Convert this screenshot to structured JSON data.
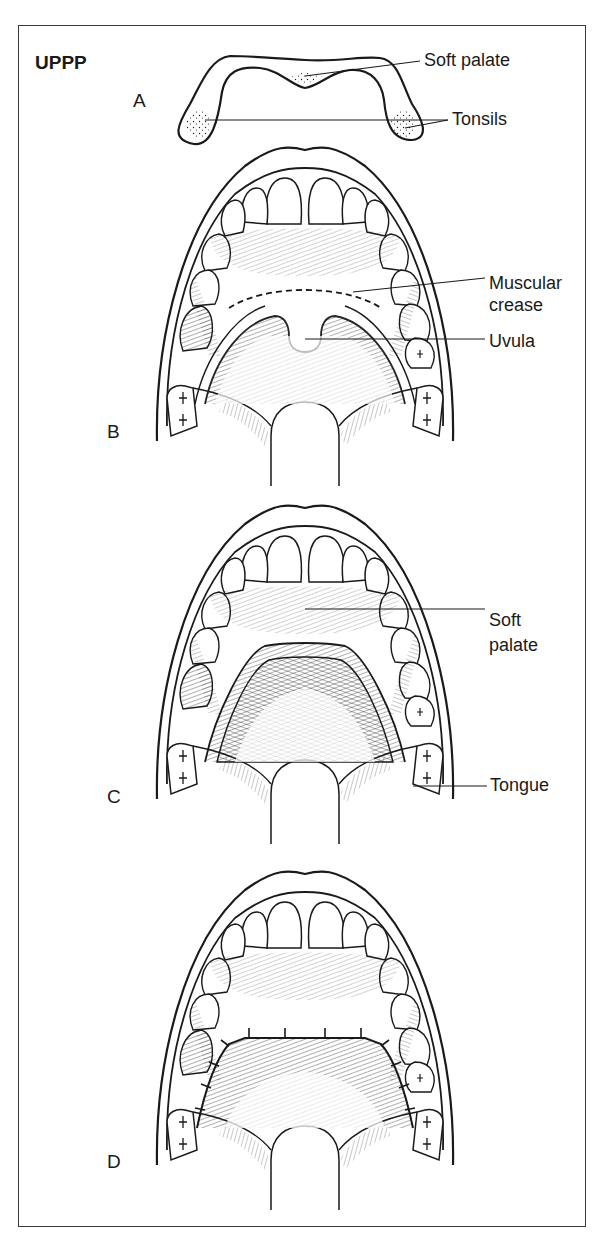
{
  "figure": {
    "title": "UPPP",
    "panels": [
      {
        "id": "A",
        "label": "A",
        "callouts": [
          "Soft palate",
          "Tonsils"
        ]
      },
      {
        "id": "B",
        "label": "B",
        "callouts": [
          "Muscular crease",
          "Uvula"
        ]
      },
      {
        "id": "C",
        "label": "C",
        "callouts": [
          "Soft palate",
          "Tongue"
        ]
      },
      {
        "id": "D",
        "label": "D",
        "callouts": []
      }
    ]
  },
  "labels": {
    "a_soft_palate": "Soft palate",
    "a_tonsils": "Tonsils",
    "b_muscular": "Muscular",
    "b_crease": "crease",
    "b_uvula": "Uvula",
    "c_soft": "Soft",
    "c_palate": "palate",
    "c_tongue": "Tongue"
  },
  "colors": {
    "line": "#1a1a1a",
    "background": "#ffffff",
    "frame": "#3a3a3a"
  }
}
